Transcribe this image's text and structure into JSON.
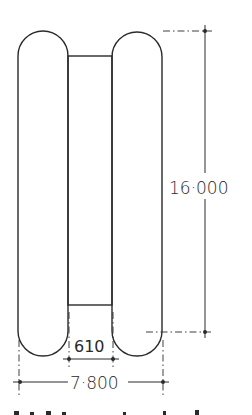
{
  "drawing": {
    "title": "",
    "stroke_color": "#2a2a2a",
    "background": "#ffffff",
    "dimensions": {
      "height_label": "16·000",
      "gap_label": "610",
      "overall_width_label": "7·800"
    },
    "shapes": [
      {
        "name": "left-capsule",
        "type": "capsule"
      },
      {
        "name": "right-capsule",
        "type": "capsule"
      },
      {
        "name": "center-connector",
        "type": "rectangle"
      }
    ]
  }
}
